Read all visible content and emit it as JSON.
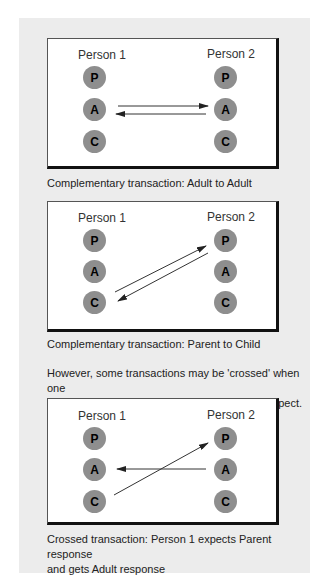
{
  "colors": {
    "background": "#ececec",
    "box": "#ffffff",
    "circle": "#8e8e8e",
    "arrow": "#222222"
  },
  "ego_states": [
    "P",
    "A",
    "C"
  ],
  "panels": [
    {
      "person1_label": "Person 1",
      "person2_label": "Person 2",
      "caption": "Complementary transaction: Adult to Adult",
      "arrows": [
        {
          "from": "Person 1 A",
          "to": "Person 2 A"
        },
        {
          "from": "Person 2 A",
          "to": "Person 1 A"
        }
      ]
    },
    {
      "person1_label": "Person 1",
      "person2_label": "Person 2",
      "caption": "Complementary transaction: Parent to Child",
      "arrows": [
        {
          "from": "Person 1 C",
          "to": "Person 2 P"
        },
        {
          "from": "Person 2 P",
          "to": "Person 1 C"
        }
      ]
    },
    {
      "person1_label": "Person 1",
      "person2_label": "Person 2",
      "caption_line1": "Crossed transaction: Person 1 expects Parent response",
      "caption_line2": "and gets Adult response",
      "arrows": [
        {
          "from": "Person 1 C",
          "to": "Person 2 P"
        },
        {
          "from": "Person 2 A",
          "to": "Person 1 A"
        }
      ]
    }
  ],
  "intro_text": {
    "line1": "However, some transactions may be 'crossed' when one",
    "line2": "person receives a response that they did not expect."
  }
}
